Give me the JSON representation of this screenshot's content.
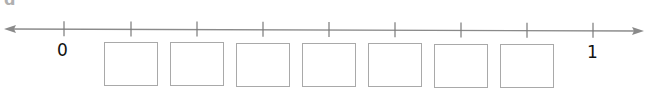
{
  "part_label": "d",
  "number_line": {
    "start_label": "0",
    "end_label": "1",
    "line_color": "#8a8a8a",
    "tick_x": [
      64,
      131,
      197,
      263,
      329,
      395,
      461,
      527,
      593
    ],
    "box_count": 7
  },
  "answer_boxes": [
    "",
    "",
    "",
    "",
    "",
    "",
    ""
  ]
}
